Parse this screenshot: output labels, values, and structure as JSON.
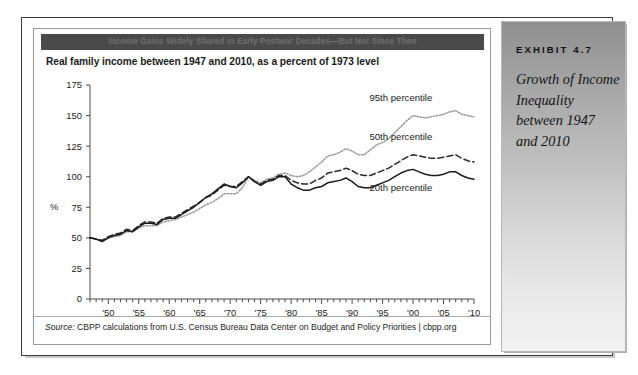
{
  "figure": {
    "banner_text": "Income Gains Widely Shared in Early Postwar Decades—But Not Since Then",
    "subtitle": "Real family income between 1947 and 2010, as a percent of 1973 level",
    "source_label": "Source:",
    "source_text": " CBPP calculations from U.S. Census Bureau Data Center on Budget and Policy Priorities | cbpp.org"
  },
  "exhibit": {
    "label": "EXHIBIT 4.7",
    "caption": "Growth of Income Inequality between 1947 and 2010"
  },
  "chart_data": {
    "type": "line",
    "title": "Income Gains Widely Shared in Early Postwar Decades—But Not Since Then",
    "subtitle": "Real family income between 1947 and 2010, as a percent of 1973 level",
    "xlabel": "",
    "ylabel": "%",
    "ylim": [
      0,
      175
    ],
    "yticks": [
      0,
      25,
      50,
      75,
      100,
      125,
      150,
      175
    ],
    "ytick_labels": [
      "0",
      "25",
      "50",
      "75",
      "100",
      "125",
      "150",
      "175"
    ],
    "xlim": [
      1947,
      2010
    ],
    "xticks": [
      1950,
      1955,
      1960,
      1965,
      1970,
      1975,
      1980,
      1985,
      1990,
      1995,
      2000,
      2005,
      2010
    ],
    "xtick_labels": [
      "'50",
      "'55",
      "'60",
      "'65",
      "'70",
      "'75",
      "'80",
      "'85",
      "'90",
      "'95",
      "'00",
      "'05",
      "'10"
    ],
    "minor_xticks_every": 1,
    "grid": false,
    "legend_position": "inline-annotations",
    "x": [
      1947,
      1948,
      1949,
      1950,
      1951,
      1952,
      1953,
      1954,
      1955,
      1956,
      1957,
      1958,
      1959,
      1960,
      1961,
      1962,
      1963,
      1964,
      1965,
      1966,
      1967,
      1968,
      1969,
      1970,
      1971,
      1972,
      1973,
      1974,
      1975,
      1976,
      1977,
      1978,
      1979,
      1980,
      1981,
      1982,
      1983,
      1984,
      1985,
      1986,
      1987,
      1988,
      1989,
      1990,
      1991,
      1992,
      1993,
      1994,
      1995,
      1996,
      1997,
      1998,
      1999,
      2000,
      2001,
      2002,
      2003,
      2004,
      2005,
      2006,
      2007,
      2008,
      2009,
      2010
    ],
    "series": [
      {
        "name": "95th percentile",
        "style": "dotted",
        "color": "#9a9a9a",
        "values": [
          50,
          49,
          48,
          50,
          51,
          52,
          55,
          55,
          58,
          60,
          60,
          60,
          63,
          64,
          65,
          67,
          69,
          71,
          74,
          77,
          79,
          82,
          86,
          86,
          86,
          91,
          100,
          97,
          95,
          98,
          99,
          102,
          103,
          101,
          100,
          101,
          104,
          108,
          112,
          117,
          118,
          120,
          123,
          121,
          118,
          118,
          122,
          126,
          128,
          131,
          136,
          141,
          146,
          150,
          149,
          148,
          149,
          150,
          151,
          153,
          154,
          151,
          150,
          149
        ]
      },
      {
        "name": "50th percentile",
        "style": "dashed",
        "color": "#2b2b2b",
        "values": [
          50,
          49,
          48,
          51,
          53,
          54,
          57,
          56,
          60,
          63,
          63,
          62,
          66,
          67,
          67,
          70,
          73,
          76,
          79,
          83,
          85,
          89,
          93,
          92,
          92,
          96,
          100,
          96,
          94,
          97,
          98,
          101,
          101,
          97,
          95,
          94,
          94,
          97,
          99,
          103,
          104,
          105,
          107,
          105,
          102,
          101,
          101,
          103,
          105,
          107,
          110,
          113,
          116,
          118,
          117,
          116,
          115,
          115,
          116,
          117,
          118,
          115,
          113,
          112
        ]
      },
      {
        "name": "20th percentile",
        "style": "solid",
        "color": "#1a1a1a",
        "values": [
          50,
          49,
          47,
          50,
          52,
          53,
          56,
          55,
          59,
          62,
          62,
          61,
          65,
          66,
          66,
          69,
          72,
          75,
          79,
          83,
          86,
          90,
          94,
          92,
          91,
          95,
          100,
          96,
          93,
          96,
          97,
          100,
          100,
          94,
          91,
          89,
          89,
          91,
          92,
          95,
          96,
          97,
          99,
          96,
          92,
          91,
          91,
          93,
          95,
          97,
          100,
          103,
          105,
          106,
          104,
          102,
          101,
          101,
          102,
          104,
          104,
          101,
          99,
          98
        ]
      }
    ],
    "annotations": [
      {
        "text": "95th percentile",
        "x": 1998,
        "y": 162
      },
      {
        "text": "50th percentile",
        "x": 1998,
        "y": 130
      },
      {
        "text": "20th percentile",
        "x": 1998,
        "y": 88
      }
    ]
  }
}
